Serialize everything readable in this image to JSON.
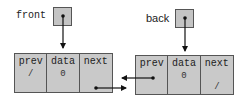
{
  "pointers": {
    "front": {
      "label": "front"
    },
    "back": {
      "label": "back"
    }
  },
  "nodes": [
    {
      "cells": [
        {
          "name": "prev",
          "value": "/"
        },
        {
          "name": "data",
          "value": "0"
        },
        {
          "name": "next",
          "value": ""
        }
      ]
    },
    {
      "cells": [
        {
          "name": "prev",
          "value": ""
        },
        {
          "name": "data",
          "value": "0"
        },
        {
          "name": "next",
          "value": "/"
        }
      ]
    }
  ],
  "colors": {
    "box_fill": "#c9c9c9",
    "border": "#555555",
    "arrow": "#111111"
  }
}
